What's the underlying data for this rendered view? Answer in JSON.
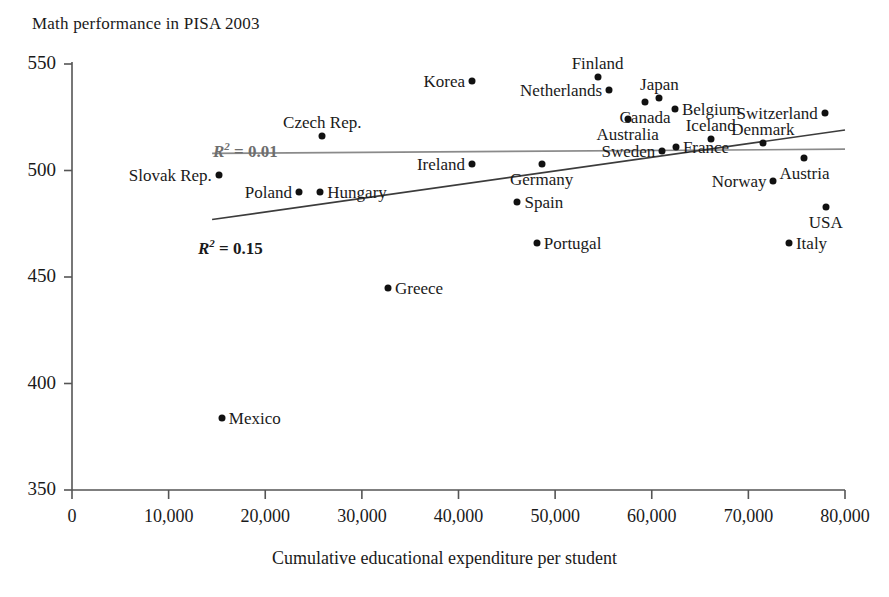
{
  "chart_data": {
    "type": "scatter",
    "title": "Math performance in PISA 2003",
    "xlabel": "Cumulative educational expenditure per student",
    "ylabel": "",
    "xlim": [
      0,
      80000
    ],
    "ylim": [
      350,
      550
    ],
    "xticks": [
      0,
      10000,
      20000,
      30000,
      40000,
      50000,
      60000,
      70000,
      80000
    ],
    "xticklabels": [
      "0",
      "10,000",
      "20,000",
      "30,000",
      "40,000",
      "50,000",
      "60,000",
      "70,000",
      "80,000"
    ],
    "yticks": [
      350,
      400,
      450,
      500,
      550
    ],
    "yticklabels": [
      "350",
      "400",
      "450",
      "500",
      "550"
    ],
    "grid": false,
    "legend": "none",
    "points": [
      {
        "name": "Mexico",
        "x": 15500,
        "y": 384,
        "label_pos": "right"
      },
      {
        "name": "Slovak Rep.",
        "x": 15200,
        "y": 498,
        "label_pos": "left"
      },
      {
        "name": "Poland",
        "x": 23500,
        "y": 490,
        "label_pos": "left"
      },
      {
        "name": "Hungary",
        "x": 25700,
        "y": 490,
        "label_pos": "right"
      },
      {
        "name": "Czech Rep.",
        "x": 25900,
        "y": 516,
        "label_pos": "above"
      },
      {
        "name": "Greece",
        "x": 32700,
        "y": 445,
        "label_pos": "right"
      },
      {
        "name": "Ireland",
        "x": 41400,
        "y": 503,
        "label_pos": "left"
      },
      {
        "name": "Korea",
        "x": 41400,
        "y": 542,
        "label_pos": "left"
      },
      {
        "name": "Spain",
        "x": 46100,
        "y": 485,
        "label_pos": "right"
      },
      {
        "name": "Portugal",
        "x": 48100,
        "y": 466,
        "label_pos": "right"
      },
      {
        "name": "Germany",
        "x": 48600,
        "y": 503,
        "label_pos": "below"
      },
      {
        "name": "Finland",
        "x": 54400,
        "y": 544,
        "label_pos": "above"
      },
      {
        "name": "Netherlands",
        "x": 55600,
        "y": 538,
        "label_pos": "left"
      },
      {
        "name": "Australia",
        "x": 57500,
        "y": 524,
        "label_pos": "below"
      },
      {
        "name": "Canada",
        "x": 59300,
        "y": 532,
        "label_pos": "below"
      },
      {
        "name": "Japan",
        "x": 60800,
        "y": 534,
        "label_pos": "above"
      },
      {
        "name": "Sweden",
        "x": 61100,
        "y": 509,
        "label_pos": "left"
      },
      {
        "name": "France",
        "x": 62500,
        "y": 511,
        "label_pos": "right"
      },
      {
        "name": "Belgium",
        "x": 62400,
        "y": 529,
        "label_pos": "right"
      },
      {
        "name": "Iceland",
        "x": 66100,
        "y": 515,
        "label_pos": "above"
      },
      {
        "name": "Denmark",
        "x": 71500,
        "y": 513,
        "label_pos": "above"
      },
      {
        "name": "Norway",
        "x": 72600,
        "y": 495,
        "label_pos": "left"
      },
      {
        "name": "Austria",
        "x": 75800,
        "y": 506,
        "label_pos": "below"
      },
      {
        "name": "Italy",
        "x": 74200,
        "y": 466,
        "label_pos": "right"
      },
      {
        "name": "USA",
        "x": 78000,
        "y": 483,
        "label_pos": "below"
      },
      {
        "name": "Switzerland",
        "x": 77900,
        "y": 527,
        "label_pos": "left"
      }
    ],
    "trendlines": [
      {
        "name": "flat-trendline",
        "r2_label": "0.01",
        "color": "#8a8a8a",
        "x_start": 14500,
        "y_start": 508,
        "x_end": 80000,
        "y_end": 510
      },
      {
        "name": "sloped-trendline",
        "r2_label": "0.15",
        "color": "#3c3c3c",
        "x_start": 14500,
        "y_start": 477,
        "x_end": 80000,
        "y_end": 519
      }
    ],
    "annotations": [
      {
        "name": "r2-upper",
        "prefix": "R",
        "sup": "2",
        "text": " = 0.01",
        "color": "#6e6e6e"
      },
      {
        "name": "r2-lower",
        "prefix": "R",
        "sup": "2",
        "text": " = 0.15",
        "color": "#1a1a1a"
      }
    ]
  }
}
